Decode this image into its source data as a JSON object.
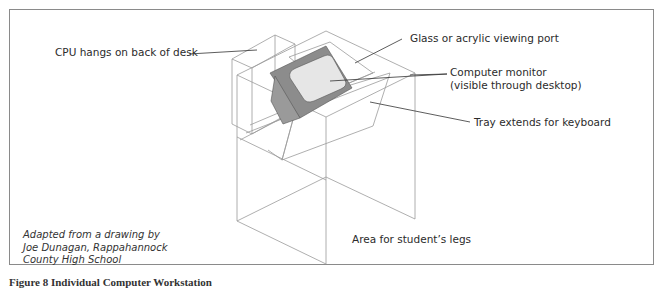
{
  "figure": {
    "labels": {
      "cpu": "CPU hangs on back of desk",
      "glass": "Glass or acrylic viewing port",
      "monitor_line1": "Computer monitor",
      "monitor_line2": "(visible through desktop)",
      "tray": "Tray extends for keyboard",
      "legs": "Area for student’s legs"
    },
    "credit": {
      "line1": "Adapted from a drawing by",
      "line2": "Joe Dunagan, Rappahannock",
      "line3": "County High School"
    },
    "caption": "Figure 8   Individual Computer Workstation",
    "colors": {
      "line": "#9a9a9a",
      "monitor_bezel": "#8c8c8c",
      "monitor_screen": "#e6e6e6",
      "frame": "#8a8a8a"
    }
  }
}
